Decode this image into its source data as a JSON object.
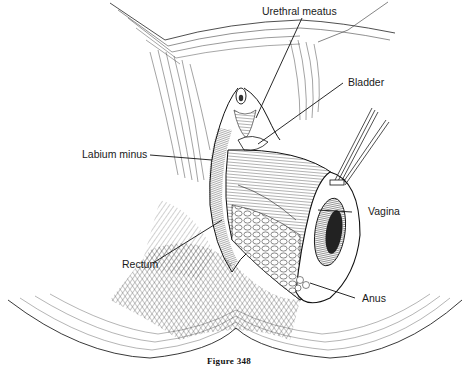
{
  "figure": {
    "caption": "Figure 348"
  },
  "labels": {
    "urethral_meatus": "Urethral meatus",
    "bladder": "Bladder",
    "labium_minus": "Labium minus",
    "vagina": "Vagina",
    "rectum": "Rectum",
    "anus": "Anus"
  },
  "colors": {
    "ink": "#1a1a1a",
    "background": "#ffffff"
  }
}
